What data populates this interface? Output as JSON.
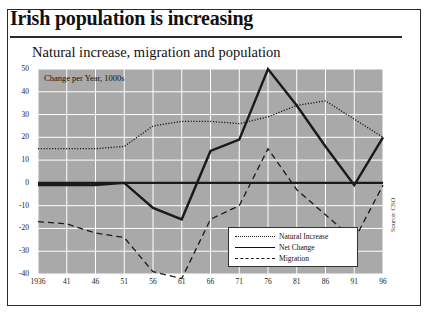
{
  "headline": "Irish population is increasing",
  "subtitle": "Natural increase, migration and population",
  "annotation": "Change per Year, 1000s",
  "source": "Source: CSO",
  "legend": {
    "items": [
      {
        "label": "Natural Increase",
        "style": "dotted"
      },
      {
        "label": "Net Change",
        "style": "solid"
      },
      {
        "label": "Migration",
        "style": "dashed"
      }
    ]
  },
  "colors": {
    "plot_background": "#a9a9a9",
    "gridline": "#ffffff",
    "series_line": "#1a1a1a",
    "frame_border": "#2b2b2b",
    "page_background": "#ffffff"
  },
  "chart_data": {
    "type": "line",
    "title": "Natural increase, migration and population",
    "subtitle": "Change per Year, 1000s",
    "xlabel": "",
    "ylabel": "Change per Year, 1000s",
    "ylim": [
      -40,
      50
    ],
    "xlim": [
      1936,
      1996
    ],
    "grid": true,
    "legend_position": "bottom-right",
    "categories": [
      "1936",
      "41",
      "46",
      "51",
      "56",
      "61",
      "66",
      "71",
      "76",
      "81",
      "86",
      "91",
      "96"
    ],
    "x": [
      1936,
      1941,
      1946,
      1951,
      1956,
      1961,
      1966,
      1971,
      1976,
      1981,
      1986,
      1991,
      1996
    ],
    "yticks": [
      50,
      40,
      30,
      20,
      10,
      0,
      -10,
      -20,
      -30,
      -40
    ],
    "series": [
      {
        "name": "Natural Increase",
        "style": "dotted",
        "values": [
          15,
          15,
          15,
          16,
          25,
          27,
          27,
          26,
          29,
          34,
          36,
          28,
          20
        ]
      },
      {
        "name": "Net Change",
        "style": "solid",
        "values": [
          -1,
          -1,
          -1,
          0,
          -11,
          -16,
          14,
          19,
          50,
          34,
          16,
          -1,
          20
        ]
      },
      {
        "name": "Migration",
        "style": "dashed",
        "values": [
          -17,
          -18,
          -22,
          -24,
          -39,
          -42,
          -16,
          -10,
          15,
          -3,
          -14,
          -25,
          -1
        ]
      }
    ]
  }
}
